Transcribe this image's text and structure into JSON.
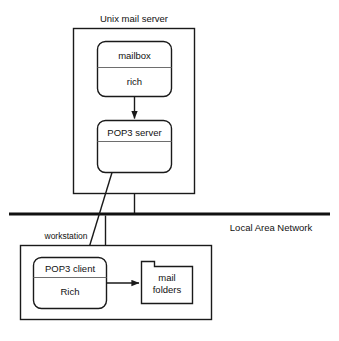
{
  "diagram": {
    "title_visible": false,
    "colors": {
      "stroke": "#1a1a1a",
      "text": "#111111",
      "background": "#ffffff",
      "lan_bar": "#111111"
    },
    "server_container": {
      "label": "Unix mail server",
      "border": "rectangle"
    },
    "mailbox_node": {
      "header": "mailbox",
      "body": "rich",
      "shape": "rounded-rectangle"
    },
    "pop3_server_node": {
      "header": "POP3 server",
      "body": "",
      "shape": "rounded-rectangle"
    },
    "network": {
      "label": "Local Area Network",
      "style": "thick-horizontal-bus"
    },
    "workstation_container": {
      "label": "workstation",
      "border": "rectangle"
    },
    "pop3_client_node": {
      "header": "POP3 client",
      "body": "Rich",
      "shape": "rounded-rectangle"
    },
    "mail_folders_node": {
      "line1": "mail",
      "line2": "folders",
      "shape": "folder"
    },
    "arrows": [
      {
        "name": "mailbox-to-pop3-server",
        "from": "mailbox",
        "to": "POP3 server",
        "kind": "vertical-arrow"
      },
      {
        "name": "pop3-server-to-pop3-client",
        "from": "POP3 server",
        "to": "POP3 client",
        "kind": "diagonal-arrow"
      },
      {
        "name": "pop3-client-to-mail-folders",
        "from": "POP3 client",
        "to": "mail folders",
        "kind": "horizontal-arrow"
      }
    ],
    "connectors": [
      {
        "name": "server-to-lan-drop",
        "kind": "vertical-line"
      },
      {
        "name": "lan-to-workstation-drop",
        "kind": "vertical-line"
      }
    ]
  }
}
